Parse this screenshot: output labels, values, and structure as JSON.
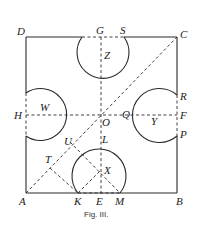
{
  "caption": "Fig. III.",
  "colors": {
    "ink": "#2a2a2a",
    "background": "#ffffff"
  },
  "points": {
    "A": "A",
    "B": "B",
    "C": "C",
    "D": "D",
    "E": "E",
    "F": "F",
    "G": "G",
    "H": "H",
    "K": "K",
    "L": "L",
    "M": "M",
    "O": "O",
    "P": "P",
    "Q": "Q",
    "R": "R",
    "S": "S",
    "T": "T",
    "U": "U"
  },
  "circles": {
    "W": "W",
    "X": "X",
    "Y": "Y",
    "Z": "Z"
  }
}
